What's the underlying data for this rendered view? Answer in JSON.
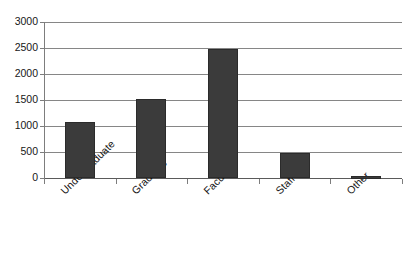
{
  "chart_data": {
    "type": "bar",
    "title": "",
    "subtitle": "",
    "xlabel": "",
    "ylabel": "",
    "categories": [
      "Undergraduate",
      "Graduate",
      "Faculty",
      "Staff",
      "Other"
    ],
    "values": [
      1080,
      1520,
      2480,
      490,
      30
    ],
    "series": [
      {
        "name": "Count",
        "values": [
          1080,
          1520,
          2480,
          490,
          30
        ]
      }
    ],
    "ylim": [
      0,
      3000
    ],
    "ytick_labels": [
      "0",
      "500",
      "1000",
      "1500",
      "2000",
      "2500",
      "3000"
    ],
    "ytick_values": [
      0,
      500,
      1000,
      1500,
      2000,
      2500,
      3000
    ],
    "grid": true,
    "legend": "none",
    "bar_color": "#3b3b3b",
    "gridline_color": "#868686",
    "axis_color": "#7d7d7d",
    "background": "#ffffff",
    "xlabel_rotation": -45
  }
}
